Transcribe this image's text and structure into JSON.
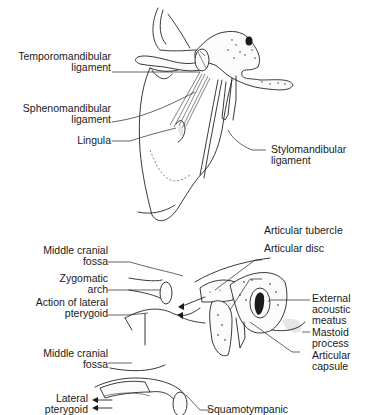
{
  "figure": {
    "top_panel": {
      "name": "Mandibular ligaments (medial view)",
      "labels": [
        {
          "id": "temporomandibular",
          "lines": [
            "Temporomandibular",
            "ligament"
          ]
        },
        {
          "id": "sphenomandibular",
          "lines": [
            "Sphenomandibular",
            "ligament"
          ]
        },
        {
          "id": "lingula",
          "lines": [
            "Lingula"
          ]
        },
        {
          "id": "stylomandibular",
          "lines": [
            "Stylomandibular",
            "ligament"
          ]
        }
      ]
    },
    "middle_panel": {
      "name": "Temporomandibular joint (lateral view)",
      "labels": [
        {
          "id": "articular-tubercle",
          "lines": [
            "Articular tubercle"
          ]
        },
        {
          "id": "articular-disc",
          "lines": [
            "Articular disc"
          ]
        },
        {
          "id": "middle-cranial-fossa-1",
          "lines": [
            "Middle cranial",
            "fossa"
          ]
        },
        {
          "id": "zygomatic-arch",
          "lines": [
            "Zygomatic",
            "arch"
          ]
        },
        {
          "id": "action-lateral-pterygoid",
          "lines": [
            "Action of lateral",
            "pterygoid"
          ]
        },
        {
          "id": "external-acoustic-meatus",
          "lines": [
            "External",
            "acoustic",
            "meatus"
          ]
        },
        {
          "id": "mastoid-process",
          "lines": [
            "Mastoid",
            "process"
          ]
        },
        {
          "id": "articular-capsule",
          "lines": [
            "Articular",
            "capsule"
          ]
        }
      ]
    },
    "bottom_panel": {
      "name": "Temporomandibular joint (sagittal section)",
      "labels": [
        {
          "id": "middle-cranial-fossa-2",
          "lines": [
            "Middle cranial",
            "fossa"
          ]
        },
        {
          "id": "lateral-pterygoid",
          "lines": [
            "Lateral",
            "pterygoid"
          ]
        },
        {
          "id": "squamotympanic",
          "lines": [
            "Squamotympanic"
          ]
        }
      ]
    }
  }
}
